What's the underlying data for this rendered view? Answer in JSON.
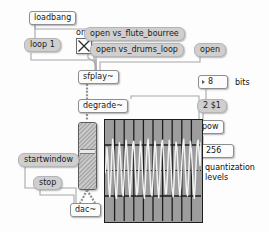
{
  "patch": {
    "title": "pd-patch-sfplay-degrade",
    "background": "#fdfdfd"
  },
  "objects": {
    "loadbang": "loadbang",
    "sfplay": "sfplay~",
    "degrade": "degrade~",
    "pow": "pow",
    "dac": "dac~"
  },
  "messages": {
    "loop": "loop 1",
    "open_flute": "open vs_flute_bourree",
    "open_drums": "open vs_drums_loop",
    "open": "open",
    "two_dollar_one": "2 $1",
    "startwindow": "startwindow",
    "stop": "stop"
  },
  "numbers": {
    "bits_value": "8",
    "levels_value": "256"
  },
  "comments": {
    "on_off": "on off",
    "bits": "bits",
    "quantization": "quantization",
    "levels": "levels"
  },
  "toggle": {
    "state": "on",
    "glyph": "x-cross"
  },
  "slider": {
    "name": "vertical-slider",
    "value_position_pct": 62
  },
  "chart_data": {
    "type": "line",
    "title": "",
    "xlabel": "",
    "ylabel": "",
    "grid": true,
    "grid_cols": 10,
    "grid_rows": 3,
    "zero_line": true,
    "ylim": [
      -1,
      1
    ],
    "xlim": [
      0,
      100
    ],
    "series": [
      {
        "name": "degraded waveform",
        "color": "#f2f2f2",
        "x": [
          0,
          1,
          2,
          3,
          4,
          5,
          6,
          7,
          8,
          9,
          10,
          11,
          12,
          13,
          14,
          15,
          16,
          17,
          18,
          19,
          20,
          21,
          22,
          23,
          24,
          25,
          26,
          27,
          28,
          29,
          30,
          31,
          32,
          33,
          34,
          35,
          36,
          37,
          38,
          39,
          40,
          41,
          42,
          43,
          44,
          45,
          46,
          47,
          48,
          49,
          50,
          51,
          52,
          53,
          54,
          55,
          56,
          57,
          58,
          59,
          60,
          61,
          62,
          63,
          64,
          65,
          66,
          67,
          68,
          69,
          70,
          71,
          72,
          73,
          74,
          75,
          76,
          77,
          78,
          79,
          80,
          81,
          82,
          83,
          84,
          85,
          86,
          87,
          88,
          89,
          90,
          91,
          92,
          93,
          94,
          95,
          96,
          97,
          98,
          99,
          100
        ],
        "values": [
          -0.05,
          0.1,
          0.45,
          0.22,
          -0.35,
          -0.52,
          -0.2,
          0.3,
          0.62,
          0.38,
          -0.1,
          -0.48,
          -0.55,
          -0.18,
          0.28,
          0.55,
          0.3,
          -0.05,
          -0.42,
          -0.5,
          -0.12,
          0.35,
          0.6,
          0.4,
          0.05,
          -0.3,
          -0.52,
          -0.24,
          0.2,
          0.52,
          0.58,
          0.22,
          -0.18,
          -0.48,
          -0.42,
          -0.08,
          0.3,
          0.58,
          0.35,
          -0.02,
          -0.38,
          -0.55,
          -0.26,
          0.18,
          0.5,
          0.62,
          0.28,
          -0.12,
          -0.45,
          -0.5,
          -0.15,
          0.25,
          0.58,
          0.42,
          0.02,
          -0.33,
          -0.54,
          -0.22,
          0.22,
          0.54,
          0.6,
          0.26,
          -0.15,
          -0.46,
          -0.45,
          -0.1,
          0.32,
          0.6,
          0.36,
          0.0,
          -0.4,
          -0.52,
          -0.2,
          0.28,
          0.56,
          0.44,
          0.06,
          -0.28,
          -0.5,
          -0.28,
          0.16,
          0.48,
          0.62,
          0.3,
          -0.08,
          -0.44,
          -0.5,
          -0.14,
          0.26,
          0.58,
          0.4,
          0.04,
          -0.35,
          -0.55,
          -0.24,
          0.2,
          0.52,
          0.6,
          0.34,
          0.1,
          0.55
        ]
      }
    ]
  }
}
